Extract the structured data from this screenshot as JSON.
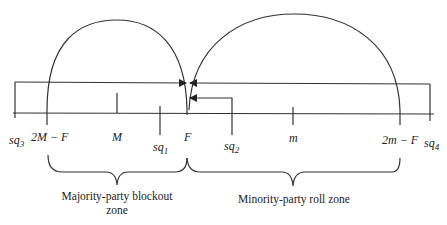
{
  "diagram": {
    "type": "spatial-voting-line",
    "axis_points": [
      {
        "id": "sq3",
        "base": "sq",
        "sub": "3"
      },
      {
        "id": "2M-F",
        "text": "2M − F"
      },
      {
        "id": "M",
        "text": "M"
      },
      {
        "id": "sq1",
        "base": "sq",
        "sub": "1"
      },
      {
        "id": "F",
        "text": "F"
      },
      {
        "id": "sq2",
        "base": "sq",
        "sub": "2"
      },
      {
        "id": "m",
        "text": "m"
      },
      {
        "id": "2m-F",
        "text": "2m − F"
      },
      {
        "id": "sq4",
        "base": "sq",
        "sub": "4"
      }
    ],
    "zones": [
      {
        "id": "majority-blockout",
        "line1": "Majority-party blockout",
        "line2": "zone"
      },
      {
        "id": "minority-roll",
        "line1": "Minority-party roll zone"
      }
    ],
    "arrows": [
      {
        "from": "sq3",
        "to": "F"
      },
      {
        "from": "sq4",
        "to": "F"
      },
      {
        "from": "sq2",
        "to": "F"
      }
    ],
    "arcs": [
      {
        "from": "2M-F",
        "to": "F",
        "center": "M"
      },
      {
        "from": "F",
        "to": "2m-F",
        "center": "m"
      }
    ],
    "line_color": "#333333"
  }
}
